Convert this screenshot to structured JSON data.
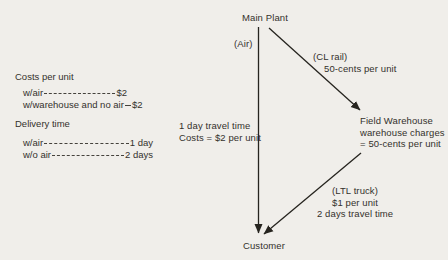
{
  "colors": {
    "background": "#f0eeea",
    "ink": "#34312c",
    "line": "#26241f"
  },
  "left_panel": {
    "costs": {
      "heading": "Costs per unit",
      "rows": [
        {
          "label": "w/air",
          "value": "$2"
        },
        {
          "label": "w/warehouse and no air",
          "value": "$2"
        }
      ]
    },
    "delivery": {
      "heading": "Delivery time",
      "rows": [
        {
          "label": "w/air",
          "value": "1 day"
        },
        {
          "label": "w/o air",
          "value": "2 days"
        }
      ]
    }
  },
  "diagram": {
    "nodes": {
      "main_plant": "Main Plant",
      "customer": "Customer",
      "field_warehouse": {
        "lines": [
          "Field Warehouse",
          "warehouse charges",
          "= 50-cents per unit"
        ]
      }
    },
    "routes": {
      "air": {
        "mode": "(Air)",
        "info_line1": "1 day travel time",
        "info_line2": "Costs = $2 per unit"
      },
      "rail": {
        "mode": "(CL rail)",
        "cost": "50-cents per unit"
      },
      "truck": {
        "mode": "(LTL truck)",
        "cost": "$1 per unit",
        "time": "2 days travel time"
      }
    }
  }
}
